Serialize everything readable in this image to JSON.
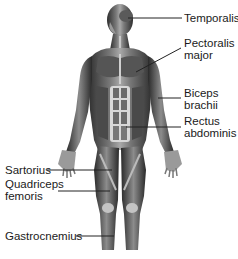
{
  "diagram": {
    "colors": {
      "background": "#ffffff",
      "muscle_dark": "#3a3a3a",
      "muscle_mid": "#6e6e6e",
      "muscle_light": "#b8b8b8",
      "tendon": "#d8d8d8",
      "leader_line": "#222222",
      "text": "#1a1a1a"
    },
    "labels_right": [
      {
        "id": "temporalis",
        "lines": [
          "Temporalis"
        ]
      },
      {
        "id": "pectoralis-major",
        "lines": [
          "Pectoralis",
          "major"
        ]
      },
      {
        "id": "biceps-brachii",
        "lines": [
          "Biceps",
          "brachii"
        ]
      },
      {
        "id": "rectus-abdominis",
        "lines": [
          "Rectus",
          "abdominis"
        ]
      }
    ],
    "labels_left": [
      {
        "id": "sartorius",
        "lines": [
          "Sartorius"
        ]
      },
      {
        "id": "quadriceps-femoris",
        "lines": [
          "Quadriceps",
          "femoris"
        ]
      },
      {
        "id": "gastrocnemius",
        "lines": [
          "Gastrocnemius"
        ]
      }
    ]
  }
}
